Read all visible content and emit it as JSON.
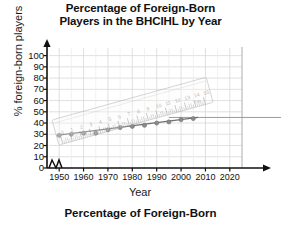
{
  "title": {
    "line1": "Percentage of Foreign-Born",
    "line2": "Players in the BHCIHL by Year"
  },
  "caption": "Percentage of Foreign-Born",
  "chart_data": {
    "type": "scatter",
    "title": "Percentage of Foreign-Born Players in the BHCIHL by Year",
    "xlabel": "Year",
    "ylabel": "% foreign-born players",
    "xlim": [
      1945,
      2025
    ],
    "ylim": [
      0,
      105
    ],
    "xticks": [
      1950,
      1960,
      1970,
      1980,
      1990,
      2000,
      2010,
      2020
    ],
    "yticks": [
      0,
      10,
      20,
      30,
      40,
      50,
      60,
      70,
      80,
      90,
      100
    ],
    "grid": true,
    "legend": false,
    "axis_break": true,
    "x": [
      1950,
      1955,
      1960,
      1965,
      1970,
      1975,
      1980,
      1985,
      1990,
      1995,
      2000,
      2005
    ],
    "values": [
      29,
      30,
      31,
      31,
      34,
      36,
      37,
      38,
      40,
      41,
      43,
      44
    ],
    "series": [
      {
        "name": "foreign-born players",
        "values": [
          29,
          30,
          31,
          31,
          34,
          36,
          37,
          38,
          40,
          41,
          43,
          44
        ]
      }
    ],
    "trend_line": {
      "x1": 1949,
      "y1": 29,
      "x2": 2007,
      "y2": 45
    },
    "reference_line": {
      "y": 45,
      "extends_right": true
    },
    "colors": {
      "point": "#8a8a8a",
      "trend": "#6f6f6f",
      "grid": "#d8d8d8",
      "axis": "#111111",
      "reference": "#9a9a9a"
    }
  },
  "ruler": {
    "ticks": [
      "0",
      "1",
      "2",
      "3",
      "4",
      "5",
      "6",
      "7",
      "8",
      "9",
      "10",
      "11",
      "12",
      "13",
      "14",
      "15"
    ],
    "unit_label": "cm"
  }
}
